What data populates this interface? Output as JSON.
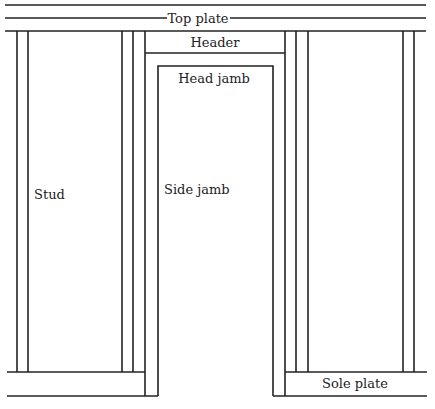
{
  "diagram": {
    "type": "wall framing with door rough opening",
    "stroke_color": "#222222",
    "background": "#ffffff",
    "labels": {
      "top_plate": "Top plate",
      "header": "Header",
      "head_jamb": "Head jamb",
      "stud": "Stud",
      "side_jamb": "Side jamb",
      "sole_plate": "Sole plate"
    }
  }
}
